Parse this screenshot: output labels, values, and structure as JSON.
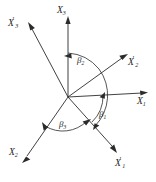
{
  "figure": {
    "background_color": "#ffffff",
    "line_color": "#2b2b2b",
    "text_color": "#1d1d1d",
    "origin": {
      "x": 68,
      "y": 97
    }
  },
  "axes": [
    {
      "id": "x3",
      "label_base": "X",
      "label_sub": "3",
      "label_prime": "",
      "label_text": "X3",
      "direction": "up",
      "label_x": 57,
      "label_y": 6,
      "tip_x": 68,
      "tip_y": 19
    },
    {
      "id": "x1",
      "label_base": "X",
      "label_sub": "1",
      "label_prime": "",
      "label_text": "X1",
      "direction": "right",
      "label_x": 137,
      "label_y": 97,
      "tip_x": 147,
      "tip_y": 95
    },
    {
      "id": "x2",
      "label_base": "X",
      "label_sub": "2",
      "label_prime": "",
      "label_text": "X2",
      "direction": "down-left",
      "label_x": 9,
      "label_y": 148,
      "tip_x": 21,
      "tip_y": 160
    },
    {
      "id": "x3-prime",
      "label_base": "X",
      "label_sub": "3",
      "label_prime": "'",
      "label_text": "X'3",
      "direction": "up-left",
      "label_x": 8,
      "label_y": 19,
      "tip_x": 27,
      "tip_y": 24
    },
    {
      "id": "x2-prime",
      "label_base": "X",
      "label_sub": "2",
      "label_prime": "'",
      "label_text": "X'2",
      "direction": "up-right",
      "label_x": 128,
      "label_y": 58,
      "tip_x": 127,
      "tip_y": 52
    },
    {
      "id": "x1-prime",
      "label_base": "X",
      "label_sub": "1",
      "label_prime": "'",
      "label_text": "X'1",
      "direction": "down-right",
      "label_x": 115,
      "label_y": 159,
      "tip_x": 117,
      "tip_y": 152
    }
  ],
  "angles": [
    {
      "id": "beta1",
      "symbol": "β",
      "sub": "1",
      "label_text": "β1",
      "between": [
        "X1",
        "X'1"
      ],
      "label_x": 99,
      "label_y": 110
    },
    {
      "id": "beta2",
      "symbol": "β",
      "sub": "2",
      "label_text": "β2",
      "between": [
        "X3",
        "X'2"
      ],
      "label_x": 77,
      "label_y": 56
    },
    {
      "id": "beta3",
      "symbol": "β",
      "sub": "3",
      "label_text": "β3",
      "between": [
        "X2",
        "X'1"
      ],
      "label_x": 59,
      "label_y": 120
    }
  ]
}
